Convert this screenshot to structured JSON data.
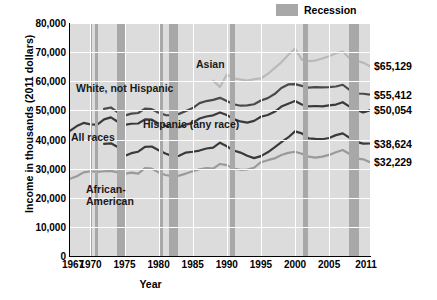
{
  "chart_data": {
    "type": "line",
    "title": "",
    "xlabel": "Year",
    "ylabel": "Income in thousands (2011 dollars)",
    "xlim": [
      1967,
      2011
    ],
    "ylim": [
      0,
      80000
    ],
    "xticks": [
      1967,
      1970,
      1975,
      1980,
      1985,
      1990,
      1995,
      2000,
      2005,
      2011
    ],
    "yticks": [
      0,
      10000,
      20000,
      30000,
      40000,
      50000,
      60000,
      70000,
      80000
    ],
    "ytick_labels": [
      "0",
      "10,000",
      "20,000",
      "30,000",
      "40,000",
      "50,000",
      "60,000",
      "70,000",
      "80,000"
    ],
    "grid": "both",
    "legend_position": "top-right",
    "legend": [
      {
        "label": "Recession",
        "color": "#a8a8a8",
        "type": "band"
      }
    ],
    "series": [
      {
        "name": "Asian",
        "color": "#b9b9b9",
        "end_label": "$65,129",
        "x": [
          1988,
          1989,
          1990,
          1991,
          1992,
          1993,
          1994,
          1995,
          1996,
          1997,
          1998,
          1999,
          2000,
          2001,
          2002,
          2003,
          2004,
          2005,
          2006,
          2007,
          2008,
          2009,
          2010,
          2011
        ],
        "y": [
          60200,
          58000,
          62300,
          61000,
          60600,
          60200,
          60700,
          61000,
          62500,
          64500,
          66500,
          69000,
          71200,
          67400,
          66900,
          67100,
          67800,
          68600,
          69600,
          70200,
          67900,
          67000,
          66400,
          65129
        ]
      },
      {
        "name": "White, not Hispanic",
        "color": "#4a4a4a",
        "end_label": "$55,412",
        "x": [
          1972,
          1973,
          1974,
          1975,
          1976,
          1977,
          1978,
          1979,
          1980,
          1981,
          1982,
          1983,
          1984,
          1985,
          1986,
          1987,
          1988,
          1989,
          1990,
          1991,
          1992,
          1993,
          1994,
          1995,
          1996,
          1997,
          1998,
          1999,
          2000,
          2001,
          2002,
          2003,
          2004,
          2005,
          2006,
          2007,
          2008,
          2009,
          2010,
          2011
        ],
        "y": [
          50500,
          51000,
          49300,
          48200,
          48900,
          49100,
          50600,
          50400,
          49200,
          48400,
          48300,
          48800,
          49800,
          50800,
          52500,
          53200,
          53600,
          54300,
          53200,
          52100,
          51600,
          51700,
          52100,
          53400,
          54200,
          55600,
          57700,
          58900,
          59000,
          58400,
          57800,
          58000,
          57900,
          58000,
          58200,
          58800,
          57000,
          55800,
          55700,
          55412
        ]
      },
      {
        "name": "All races",
        "color": "#3a3a3a",
        "end_label": "$50,054",
        "x": [
          1967,
          1968,
          1969,
          1970,
          1971,
          1972,
          1973,
          1974,
          1975,
          1976,
          1977,
          1978,
          1979,
          1980,
          1981,
          1982,
          1983,
          1984,
          1985,
          1986,
          1987,
          1988,
          1989,
          1990,
          1991,
          1992,
          1993,
          1994,
          1995,
          1996,
          1997,
          1998,
          1999,
          2000,
          2001,
          2002,
          2003,
          2004,
          2005,
          2006,
          2007,
          2008,
          2009,
          2010,
          2011
        ],
        "y": [
          43000,
          44600,
          45700,
          45200,
          45100,
          46900,
          47600,
          46100,
          45000,
          45400,
          45500,
          46900,
          46800,
          45400,
          44700,
          44100,
          44200,
          45100,
          45700,
          47200,
          47900,
          48300,
          49300,
          48400,
          47000,
          46200,
          45800,
          46400,
          47800,
          48400,
          49500,
          51300,
          52300,
          53200,
          52000,
          51400,
          51500,
          51400,
          51700,
          52000,
          52800,
          51300,
          50100,
          49300,
          50054
        ]
      },
      {
        "name": "Hispanic (any race)",
        "color": "#3a3a3a",
        "end_label": "$38,624",
        "x": [
          1972,
          1973,
          1974,
          1975,
          1976,
          1977,
          1978,
          1979,
          1980,
          1981,
          1982,
          1983,
          1984,
          1985,
          1986,
          1987,
          1988,
          1989,
          1990,
          1991,
          1992,
          1993,
          1994,
          1995,
          1996,
          1997,
          1998,
          1999,
          2000,
          2001,
          2002,
          2003,
          2004,
          2005,
          2006,
          2007,
          2008,
          2009,
          2010,
          2011
        ],
        "y": [
          38500,
          38700,
          37400,
          34300,
          35300,
          35800,
          37500,
          37600,
          36300,
          35200,
          34300,
          34400,
          35500,
          35800,
          36200,
          36900,
          37200,
          38900,
          37700,
          36200,
          35500,
          34400,
          33600,
          34300,
          35600,
          37300,
          39100,
          40700,
          42800,
          42100,
          40400,
          40200,
          40100,
          40500,
          41500,
          42100,
          40600,
          39200,
          38600,
          38624
        ]
      },
      {
        "name": "African-American",
        "color": "#9a9a9a",
        "end_label": "$32,229",
        "x": [
          1967,
          1968,
          1969,
          1970,
          1971,
          1972,
          1973,
          1974,
          1975,
          1976,
          1977,
          1978,
          1979,
          1980,
          1981,
          1982,
          1983,
          1984,
          1985,
          1986,
          1987,
          1988,
          1989,
          1990,
          1991,
          1992,
          1993,
          1994,
          1995,
          1996,
          1997,
          1998,
          1999,
          2000,
          2001,
          2002,
          2003,
          2004,
          2005,
          2006,
          2007,
          2008,
          2009,
          2010,
          2011
        ],
        "y": [
          26500,
          27400,
          28700,
          29100,
          28900,
          29100,
          29200,
          28700,
          28200,
          28600,
          28300,
          30200,
          30000,
          28700,
          27800,
          27400,
          27600,
          28300,
          29100,
          29800,
          30200,
          30000,
          31600,
          31200,
          30000,
          29600,
          29700,
          30300,
          32200,
          32900,
          33500,
          34700,
          35400,
          35800,
          35100,
          34100,
          33800,
          34100,
          34700,
          35600,
          36400,
          35000,
          33500,
          33200,
          32229
        ]
      }
    ],
    "recession_bands": [
      {
        "start": 1969.9,
        "end": 1970.3
      },
      {
        "start": 1970.7,
        "end": 1971.1
      },
      {
        "start": 1973.9,
        "end": 1975.2
      },
      {
        "start": 1980.0,
        "end": 1980.6
      },
      {
        "start": 1981.5,
        "end": 1982.9
      },
      {
        "start": 1990.5,
        "end": 1991.2
      },
      {
        "start": 2001.2,
        "end": 2001.9
      },
      {
        "start": 2007.9,
        "end": 2009.4
      }
    ],
    "annotations": [
      {
        "name": "asian",
        "text": "Asian"
      },
      {
        "name": "white-not-hispanic",
        "text": "White, not Hispanic"
      },
      {
        "name": "all-races",
        "text": "All races"
      },
      {
        "name": "hispanic",
        "text": "Hispanic (any race)"
      },
      {
        "name": "african-american-line1",
        "text": "African-"
      },
      {
        "name": "african-american-line2",
        "text": "American"
      }
    ]
  }
}
